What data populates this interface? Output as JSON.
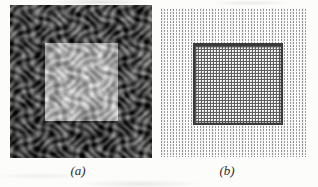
{
  "figure": {
    "captions": {
      "a": "(a)",
      "b": "(b)"
    },
    "panel_a": {
      "content": "fabric-texture-photo-with-bright-square-patch",
      "dark_tone": "#1a1a1a",
      "light_tone": "#8e8e8e",
      "square_mid_tone": "#b4b4b4",
      "square_bright_tone": "#e6e6e6",
      "square": {
        "left": 35,
        "top": 38,
        "width": 73,
        "height": 78
      }
    },
    "panel_b": {
      "content": "dash-grid-pattern-with-crosshatch-square",
      "background": "#fdfdfd",
      "dash_color": "#9c9c9c",
      "mesh_color": "#5f5f5f",
      "border_color": "#3a3a3a"
    }
  }
}
